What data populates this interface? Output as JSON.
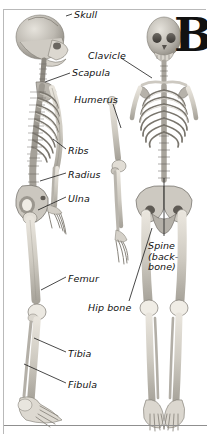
{
  "figure": {
    "title_letter": "B",
    "ground_line": true,
    "frame": true
  },
  "views": [
    {
      "name": "lateral-skeleton",
      "description": "side view human skeleton"
    },
    {
      "name": "detached-arm",
      "description": "isolated arm bones humerus radius ulna"
    },
    {
      "name": "anterior-skeleton",
      "description": "front view human skeleton"
    }
  ],
  "labels": [
    {
      "id": "skull",
      "text": "Skull",
      "x": 74,
      "y": 10
    },
    {
      "id": "clavicle",
      "text": "Clavicle",
      "x": 88,
      "y": 51
    },
    {
      "id": "scapula",
      "text": "Scapula",
      "x": 72,
      "y": 68
    },
    {
      "id": "humerus",
      "text": "Humerus",
      "x": 74,
      "y": 95
    },
    {
      "id": "ribs",
      "text": "Ribs",
      "x": 68,
      "y": 146
    },
    {
      "id": "radius",
      "text": "Radius",
      "x": 68,
      "y": 170
    },
    {
      "id": "ulna",
      "text": "Ulna",
      "x": 68,
      "y": 194
    },
    {
      "id": "femur",
      "text": "Femur",
      "x": 68,
      "y": 274
    },
    {
      "id": "hip-bone",
      "text": "Hip bone",
      "x": 88,
      "y": 303
    },
    {
      "id": "tibia",
      "text": "Tibia",
      "x": 68,
      "y": 349
    },
    {
      "id": "fibula",
      "text": "Fibula",
      "x": 68,
      "y": 380
    },
    {
      "id": "spine",
      "text": "Spine\n(back-\nbone)",
      "x": 148,
      "y": 241
    }
  ],
  "leaders": [
    {
      "id": "leader-skull",
      "x1": 66,
      "y1": 16,
      "x2": 72,
      "y2": 14
    },
    {
      "id": "leader-clavicle",
      "x1": 120,
      "y1": 58,
      "x2": 151,
      "y2": 76
    },
    {
      "id": "leader-scapula",
      "x1": 45,
      "y1": 81,
      "x2": 70,
      "y2": 73
    },
    {
      "id": "leader-humerus",
      "x1": 113,
      "y1": 104,
      "x2": 121,
      "y2": 126
    },
    {
      "id": "leader-ribs",
      "x1": 53,
      "y1": 140,
      "x2": 66,
      "y2": 149
    },
    {
      "id": "leader-radius",
      "x1": 40,
      "y1": 181,
      "x2": 66,
      "y2": 173
    },
    {
      "id": "leader-ulna",
      "x1": 38,
      "y1": 209,
      "x2": 66,
      "y2": 197
    },
    {
      "id": "leader-femur",
      "x1": 41,
      "y1": 289,
      "x2": 66,
      "y2": 277
    },
    {
      "id": "leader-hipbone",
      "x1": 128,
      "y1": 300,
      "x2": 151,
      "y2": 227
    },
    {
      "id": "leader-tibia",
      "x1": 34,
      "y1": 338,
      "x2": 66,
      "y2": 352
    },
    {
      "id": "leader-fibula",
      "x1": 24,
      "y1": 364,
      "x2": 66,
      "y2": 383
    },
    {
      "id": "leader-spine",
      "x1": 164,
      "y1": 236,
      "x2": 164,
      "y2": 180
    }
  ]
}
